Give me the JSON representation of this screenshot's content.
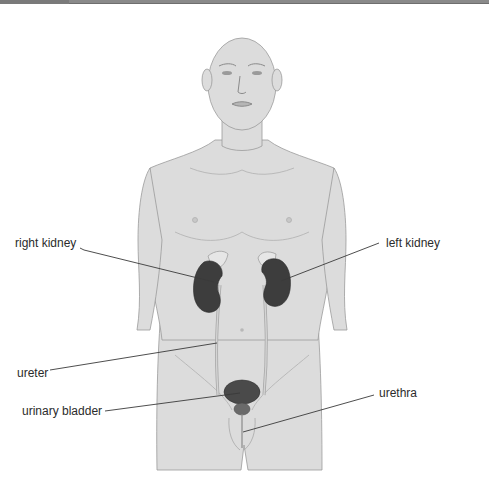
{
  "figure": {
    "colors": {
      "skin": "#dcdcdc",
      "skin_outline": "#9a9a9a",
      "organ": "#3d3d3d",
      "organ_highlight": "#5a5a5a",
      "adrenal": "#e6e6e6",
      "ureter": "#bdbdbd",
      "leader_line": "#3a3a3a",
      "label_text": "#2b2b2b"
    }
  },
  "labels": {
    "right_kidney": "right kidney",
    "left_kidney": "left kidney",
    "ureter": "ureter",
    "urinary_bladder": "urinary bladder",
    "urethra": "urethra"
  }
}
